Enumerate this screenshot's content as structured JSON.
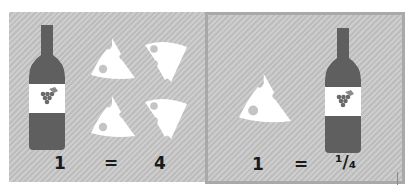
{
  "colors": {
    "panel_bg": "#c8c8c8",
    "panel_border": "#a9a9a9",
    "bottle": "#5f5f5f",
    "label": "#ffffff",
    "cheese": "#ffffff",
    "text": "#1a1a1a"
  },
  "left_panel": {
    "equation": {
      "lhs": "1",
      "op": "=",
      "rhs": "4"
    },
    "icons": [
      "wine-bottle-icon",
      "cheese-wedge-icon",
      "cheese-wedge-icon",
      "cheese-wedge-icon",
      "cheese-wedge-icon"
    ]
  },
  "right_panel": {
    "equation": {
      "lhs": "1",
      "op": "=",
      "rhs": "¹/₄"
    },
    "icons": [
      "cheese-wedge-icon",
      "wine-bottle-icon"
    ]
  }
}
